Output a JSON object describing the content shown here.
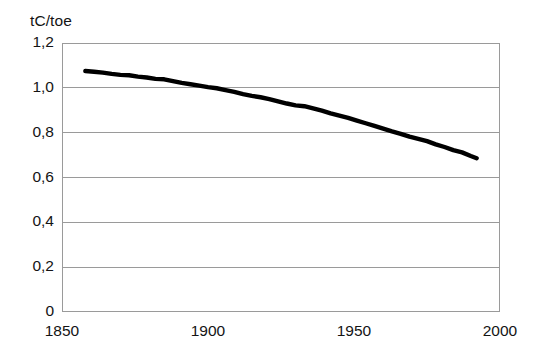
{
  "chart_data": {
    "type": "line",
    "title": "",
    "subtitle": "",
    "xlabel": "",
    "ylabel": "tC/toe",
    "y_unit_caption": "tC/toe",
    "xlim": [
      1850,
      2000
    ],
    "ylim": [
      0,
      1.2
    ],
    "grid": true,
    "legend": false,
    "legend_position": "none",
    "decimal_separator": ",",
    "x_ticks": [
      1850,
      1900,
      1950,
      2000
    ],
    "x_tick_labels": [
      "1850",
      "1900",
      "1950",
      "2000"
    ],
    "y_ticks": [
      0,
      0.2,
      0.4,
      0.6,
      0.8,
      1.0,
      1.2
    ],
    "y_tick_labels": [
      "0",
      "0,2",
      "0,4",
      "0,6",
      "0,8",
      "1,0",
      "1,2"
    ],
    "series": [
      {
        "name": "Carbon intensity of primary energy",
        "color": "#000000",
        "line_width": 4.4,
        "x": [
          1858,
          1861,
          1864,
          1867,
          1870,
          1873,
          1876,
          1879,
          1882,
          1885,
          1888,
          1891,
          1894,
          1897,
          1900,
          1903,
          1906,
          1909,
          1912,
          1915,
          1918,
          1921,
          1924,
          1927,
          1930,
          1933,
          1936,
          1939,
          1942,
          1945,
          1948,
          1951,
          1954,
          1957,
          1960,
          1963,
          1966,
          1969,
          1972,
          1975,
          1978,
          1981,
          1984,
          1987,
          1990,
          1992
        ],
        "y": [
          1.075,
          1.072,
          1.068,
          1.062,
          1.058,
          1.056,
          1.05,
          1.046,
          1.04,
          1.038,
          1.03,
          1.022,
          1.016,
          1.01,
          1.003,
          0.998,
          0.99,
          0.982,
          0.972,
          0.964,
          0.958,
          0.95,
          0.94,
          0.93,
          0.922,
          0.918,
          0.908,
          0.898,
          0.886,
          0.876,
          0.866,
          0.854,
          0.842,
          0.83,
          0.818,
          0.806,
          0.795,
          0.782,
          0.772,
          0.762,
          0.748,
          0.736,
          0.722,
          0.712,
          0.696,
          0.686
        ]
      }
    ]
  }
}
